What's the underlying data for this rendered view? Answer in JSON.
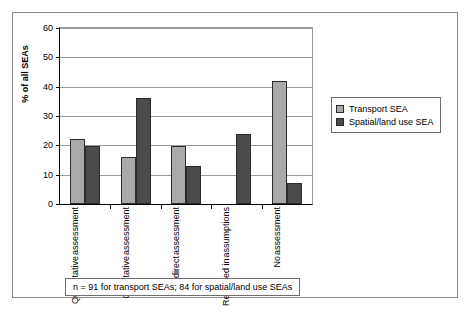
{
  "chart_data": {
    "type": "bar",
    "title": "",
    "xlabel": "",
    "ylabel": "% of all SEAs",
    "ylim": [
      0,
      60
    ],
    "yticks": [
      0,
      10,
      20,
      30,
      40,
      50,
      60
    ],
    "ytick_labels": [
      "0",
      "10",
      "20",
      "30",
      "40",
      "50",
      "60"
    ],
    "grid": true,
    "legend_position": "right",
    "categories": [
      {
        "line1": "Quantitative",
        "line2": "assessment"
      },
      {
        "line1": "Qualitative",
        "line2": "assessment"
      },
      {
        "line1": "Indirect",
        "line2": "assessment"
      },
      {
        "line1": "Reflected in",
        "line2": "assumptions"
      },
      {
        "line1": "No",
        "line2": "assessment"
      }
    ],
    "series": [
      {
        "name": "Transport SEA",
        "color": "#a9a9a9",
        "values": [
          22.0,
          16.0,
          19.8,
          0.0,
          41.8
        ]
      },
      {
        "name": "Spatial/land use SEA",
        "color": "#4b4b4b",
        "values": [
          19.8,
          36.0,
          12.8,
          23.7,
          7.0
        ]
      }
    ],
    "annotation": "n = 91 for transport SEAs; 84 for spatial/land use SEAs"
  },
  "legend": {
    "items": [
      {
        "label": "Transport SEA",
        "swatch": "light"
      },
      {
        "label": "Spatial/land use SEA",
        "swatch": "dark"
      }
    ]
  },
  "footnote": {
    "text": "n = 91 for transport SEAs; 84 for spatial/land use SEAs"
  },
  "axis": {
    "y_title": "% of all SEAs"
  }
}
